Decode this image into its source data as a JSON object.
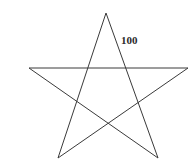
{
  "figure": {
    "name": "pentagram-star",
    "type": "geometry-diagram",
    "background_color": "#ffffff",
    "stroke_color": "#3a3a3a",
    "stroke_width": 1,
    "width": 194,
    "height": 161,
    "shape": {
      "name": "five-pointed-star",
      "description": "Unicursal five-pointed star (pentagram) drawn as five straight chords",
      "points": 5,
      "vertices": [
        {
          "name": "top",
          "x": 106,
          "y": 13
        },
        {
          "name": "bottom-right",
          "x": 158,
          "y": 158
        },
        {
          "name": "left",
          "x": 29,
          "y": 68
        },
        {
          "name": "right",
          "x": 188,
          "y": 68
        },
        {
          "name": "bottom-left",
          "x": 58,
          "y": 158
        }
      ],
      "path": "M 106 13 L 158 158 L 29 68 L 188 68 L 58 158 Z"
    },
    "labels": [
      {
        "name": "edge-length-label",
        "text": "100",
        "value": 100,
        "x": 121,
        "y": 35,
        "font_size": 11,
        "color": "#2b2b2b",
        "describes": "upper-right edge from top vertex toward bottom-right vertex"
      }
    ]
  }
}
